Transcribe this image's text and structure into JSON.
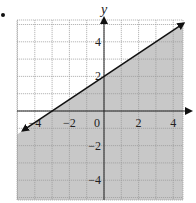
{
  "chart_data": {
    "type": "line",
    "title": "",
    "xlabel": "",
    "ylabel": "y",
    "boundary_line": {
      "slope": 0.6667,
      "intercept": 2,
      "equation": "y = (2/3)x + 2",
      "style": "solid",
      "points": [
        {
          "x": -3,
          "y": 0
        },
        {
          "x": 0,
          "y": 2
        }
      ],
      "arrows": "both ends"
    },
    "shaded_region": "below",
    "inequality": "y ≤ (2/3)x + 2",
    "x": [
      -4.7,
      4.6
    ],
    "y": [
      -1.13,
      5.07
    ],
    "xlim": [
      -5,
      4.6
    ],
    "ylim": [
      -5.1,
      5.3
    ],
    "grid": true,
    "x_ticks": [
      -4,
      -2,
      0,
      2,
      4
    ],
    "y_ticks": [
      -4,
      -2,
      2,
      4
    ],
    "x_tick_labels": [
      "−4",
      "−2",
      "0",
      "2",
      "4"
    ],
    "y_tick_labels": [
      "−4",
      "−2",
      "2",
      "4"
    ],
    "colors": {
      "shade": "#c8c8c8",
      "grid": "#9a9a9a",
      "line": "#111111",
      "background": "#ffffff"
    }
  }
}
